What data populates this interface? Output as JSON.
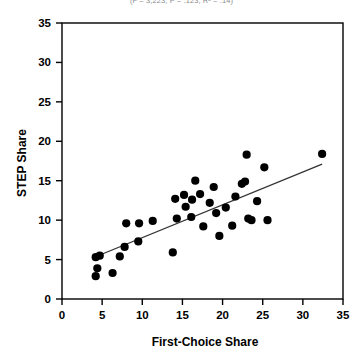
{
  "figure": {
    "caption_top": "(F = 3,223; P = .123; R² = .14)",
    "background_color": "#ffffff",
    "point_color": "#000000",
    "line_color": "#333333"
  },
  "chart_data": {
    "type": "scatter",
    "title": "",
    "xlabel": "First-Choice Share",
    "ylabel": "STEP Share",
    "xlim": [
      0,
      35
    ],
    "ylim": [
      0,
      35
    ],
    "xticks": [
      0,
      5,
      10,
      15,
      20,
      25,
      30,
      35
    ],
    "yticks": [
      0,
      5,
      10,
      15,
      20,
      25,
      30,
      35
    ],
    "xticklabels": [
      "0",
      "5",
      "10",
      "15",
      "20",
      "25",
      "30",
      "35"
    ],
    "yticklabels": [
      "0",
      "5",
      "10",
      "15",
      "20",
      "25",
      "30",
      "35"
    ],
    "grid": false,
    "legend": false,
    "legend_position": "none",
    "points": [
      [
        4.2,
        5.3
      ],
      [
        4.7,
        5.5
      ],
      [
        4.4,
        3.9
      ],
      [
        4.2,
        2.9
      ],
      [
        6.3,
        3.3
      ],
      [
        7.2,
        5.4
      ],
      [
        7.8,
        6.6
      ],
      [
        8.0,
        9.6
      ],
      [
        9.6,
        9.6
      ],
      [
        9.5,
        7.3
      ],
      [
        11.3,
        9.9
      ],
      [
        13.8,
        5.9
      ],
      [
        14.1,
        12.7
      ],
      [
        14.3,
        10.2
      ],
      [
        15.2,
        13.2
      ],
      [
        15.4,
        11.7
      ],
      [
        16.2,
        12.6
      ],
      [
        16.1,
        10.4
      ],
      [
        16.6,
        15.0
      ],
      [
        17.2,
        13.3
      ],
      [
        17.6,
        9.2
      ],
      [
        18.4,
        12.2
      ],
      [
        18.9,
        14.2
      ],
      [
        19.2,
        10.9
      ],
      [
        19.6,
        8.0
      ],
      [
        20.4,
        11.6
      ],
      [
        21.2,
        9.3
      ],
      [
        21.6,
        13.0
      ],
      [
        22.4,
        14.6
      ],
      [
        22.8,
        14.9
      ],
      [
        23.0,
        18.3
      ],
      [
        23.2,
        10.2
      ],
      [
        23.6,
        10.0
      ],
      [
        24.3,
        12.4
      ],
      [
        25.2,
        16.7
      ],
      [
        25.6,
        10.0
      ],
      [
        32.4,
        18.4
      ]
    ],
    "fit_line": {
      "label": "linear fit",
      "x": [
        3.8,
        32.4
      ],
      "y": [
        5.2,
        17.1
      ]
    }
  }
}
